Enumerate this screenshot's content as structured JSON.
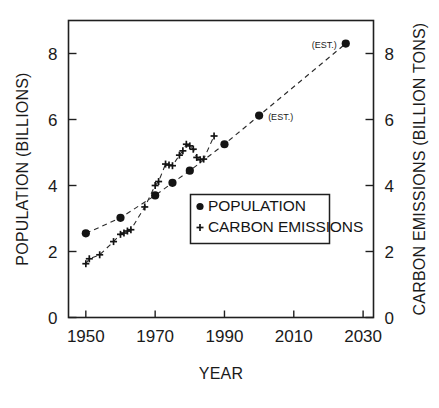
{
  "chart_data": {
    "type": "scatter",
    "title": "",
    "xlabel": "YEAR",
    "ylabel": "POPULATION (BILLIONS)",
    "y2label": "CARBON EMISSIONS (BILLION TONS)",
    "xlim": [
      1945,
      2033
    ],
    "ylim": [
      0,
      9
    ],
    "y2lim": [
      0,
      9
    ],
    "grid": false,
    "legend_position": "center",
    "xticks": [
      1950,
      1970,
      1990,
      2010,
      2030
    ],
    "xticklabels": [
      "1950",
      "1970",
      "1990",
      "2010",
      "2030"
    ],
    "yticks": [
      0,
      2,
      4,
      6,
      8
    ],
    "yticklabels": [
      "0",
      "2",
      "4",
      "6",
      "8"
    ],
    "y2ticks": [
      0,
      2,
      4,
      6,
      8
    ],
    "y2ticklabels": [
      "0",
      "2",
      "4",
      "6",
      "8"
    ],
    "series": [
      {
        "name": "POPULATION",
        "marker": "filled-circle",
        "axis": "left",
        "linestyle": "dashed",
        "points": [
          {
            "x": 1950,
            "y": 2.55
          },
          {
            "x": 1960,
            "y": 3.02
          },
          {
            "x": 1970,
            "y": 3.7
          },
          {
            "x": 1975,
            "y": 4.08
          },
          {
            "x": 1980,
            "y": 4.45
          },
          {
            "x": 1990,
            "y": 5.25
          },
          {
            "x": 2000,
            "y": 6.12,
            "label": "(EST.)",
            "label_side": "right"
          },
          {
            "x": 2025,
            "y": 8.3,
            "label": "(EST.)",
            "label_side": "left"
          }
        ]
      },
      {
        "name": "CARBON EMISSIONS",
        "marker": "plus",
        "axis": "right",
        "linestyle": "dashed",
        "points": [
          {
            "x": 1950,
            "y": 1.63
          },
          {
            "x": 1951,
            "y": 1.78
          },
          {
            "x": 1954,
            "y": 1.9
          },
          {
            "x": 1958,
            "y": 2.3
          },
          {
            "x": 1960,
            "y": 2.52
          },
          {
            "x": 1961,
            "y": 2.56
          },
          {
            "x": 1962,
            "y": 2.62
          },
          {
            "x": 1963,
            "y": 2.66
          },
          {
            "x": 1967,
            "y": 3.35
          },
          {
            "x": 1970,
            "y": 4.0
          },
          {
            "x": 1971,
            "y": 4.12
          },
          {
            "x": 1973,
            "y": 4.65
          },
          {
            "x": 1974,
            "y": 4.62
          },
          {
            "x": 1975,
            "y": 4.6
          },
          {
            "x": 1977,
            "y": 4.92
          },
          {
            "x": 1978,
            "y": 5.05
          },
          {
            "x": 1979,
            "y": 5.25
          },
          {
            "x": 1980,
            "y": 5.2
          },
          {
            "x": 1981,
            "y": 5.1
          },
          {
            "x": 1982,
            "y": 4.85
          },
          {
            "x": 1983,
            "y": 4.78
          },
          {
            "x": 1984,
            "y": 4.8
          },
          {
            "x": 1987,
            "y": 5.5
          }
        ]
      }
    ]
  },
  "annotations": {
    "est_2000": "(EST.)",
    "est_2025": "(EST.)"
  },
  "legend": {
    "entries": [
      {
        "label": "POPULATION",
        "marker": "filled-circle"
      },
      {
        "label": "CARBON EMISSIONS",
        "marker": "plus"
      }
    ]
  },
  "colors": {
    "ink": "#1a1a1a",
    "background": "#ffffff",
    "marker": "#141414"
  }
}
